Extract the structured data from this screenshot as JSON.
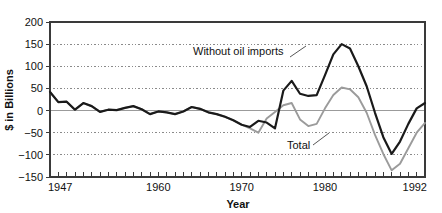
{
  "chart_data": {
    "type": "line",
    "title": "",
    "xlabel": "Year",
    "ylabel": "$ in Billions",
    "xlim": [
      1947,
      1992
    ],
    "ylim": [
      -150,
      200
    ],
    "yticks": [
      200,
      150,
      100,
      50,
      0,
      -50,
      -100,
      -150
    ],
    "ytick_labels": [
      "200",
      "150",
      "100",
      "50",
      "0",
      "−50",
      "−100",
      "−150"
    ],
    "xticks": [
      1947,
      1960,
      1970,
      1980,
      1992
    ],
    "xtick_labels": [
      "1947",
      "1960",
      "1970",
      "1980",
      "1992"
    ],
    "x_minor_tick_step": 1,
    "grid": "horizontal-dotted",
    "zero_line": true,
    "legend": "annotations",
    "x": [
      1947,
      1948,
      1949,
      1950,
      1951,
      1952,
      1953,
      1954,
      1955,
      1956,
      1957,
      1958,
      1959,
      1960,
      1961,
      1962,
      1963,
      1964,
      1965,
      1966,
      1967,
      1968,
      1969,
      1970,
      1971,
      1972,
      1973,
      1974,
      1975,
      1976,
      1977,
      1978,
      1979,
      1980,
      1981,
      1982,
      1983,
      1984,
      1985,
      1986,
      1987,
      1988,
      1989,
      1990,
      1991,
      1992
    ],
    "series": [
      {
        "name": "Without oil imports",
        "color": "#1a1a1a",
        "values": [
          42,
          19,
          20,
          2,
          17,
          10,
          -3,
          2,
          1,
          6,
          10,
          3,
          -8,
          -2,
          -4,
          -8,
          -2,
          8,
          4,
          -4,
          -8,
          -14,
          -22,
          -32,
          -37,
          -23,
          -27,
          -40,
          45,
          67,
          38,
          33,
          35,
          80,
          127,
          150,
          140,
          100,
          55,
          -5,
          -60,
          -98,
          -70,
          -30,
          5,
          17
        ]
      },
      {
        "name": "Total",
        "color": "#9b9b9b",
        "values": [
          42,
          19,
          20,
          2,
          17,
          10,
          -3,
          2,
          1,
          6,
          10,
          3,
          -8,
          -2,
          -4,
          -8,
          -2,
          8,
          4,
          -4,
          -8,
          -14,
          -22,
          -32,
          -40,
          -50,
          -18,
          -3,
          12,
          17,
          -20,
          -35,
          -30,
          5,
          35,
          52,
          48,
          30,
          -5,
          -55,
          -98,
          -135,
          -120,
          -85,
          -50,
          -28
        ]
      }
    ],
    "annotations": [
      {
        "name": "without-oil-imports",
        "text": "Without oil imports",
        "text_x": 193,
        "text_y": 55,
        "leader": [
          [
            290,
            57
          ],
          [
            306,
            46
          ]
        ]
      },
      {
        "name": "total",
        "text": "Total",
        "text_x": 287,
        "text_y": 149,
        "leader": [
          [
            313,
            145
          ],
          [
            329,
            133
          ]
        ]
      }
    ]
  },
  "geometry": {
    "plot_left": 50,
    "plot_right": 425,
    "plot_top": 22,
    "plot_bottom": 177
  },
  "colors": {
    "axis": "#3a3a3a",
    "grid": "#8a8a8a",
    "zero_line": "#9b9b9b",
    "background": "#ffffff",
    "text": "#111111"
  }
}
